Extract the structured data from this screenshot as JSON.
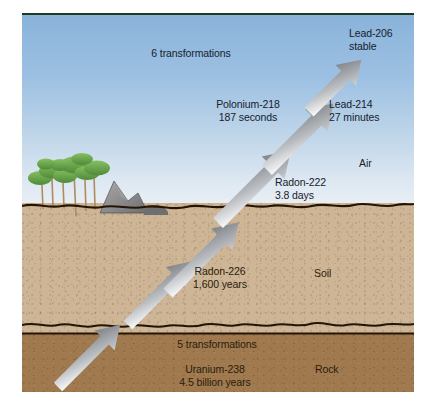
{
  "figure": {
    "layers": [
      {
        "key": "air",
        "label": "Air",
        "color": "#9cc0e2"
      },
      {
        "key": "soil",
        "label": "Soil",
        "color": "#cdb596"
      },
      {
        "key": "rock",
        "label": "Rock",
        "color": "#a07a4e"
      }
    ]
  },
  "labels": {
    "transformations_6": "6 transformations",
    "transformations_5": "5 transformations",
    "layer_air": "Air",
    "layer_soil": "Soil",
    "layer_rock": "Rock"
  },
  "nuclides": [
    {
      "id": "uranium-238",
      "name": "Uranium-238",
      "half_life": "4.5 billion years",
      "layer": "rock"
    },
    {
      "id": "radon-226",
      "name": "Radon-226",
      "half_life": "1,600 years",
      "layer": "soil"
    },
    {
      "id": "radon-222",
      "name": "Radon-222",
      "half_life": "3.8 days",
      "layer": "air"
    },
    {
      "id": "polonium-218",
      "name": "Polonium-218",
      "half_life": "187 seconds",
      "layer": "air"
    },
    {
      "id": "lead-214",
      "name": "Lead-214",
      "half_life": "27 minutes",
      "layer": "air"
    },
    {
      "id": "lead-206",
      "name": "Lead-206",
      "half_life": "stable",
      "layer": "air"
    }
  ],
  "colors": {
    "sky_top": "#8ab3da",
    "sky_bottom": "#e9eff4",
    "soil": "#cdb596",
    "rock": "#a07a4e",
    "boundary_line": "#241404",
    "arrow_head": "#7c7f84",
    "arrow_tail": "#ffffff",
    "tree_foliage": "#6aa84f",
    "tree_trunk": "#b08a60",
    "boulder": "#8d8d8d",
    "top_border": "#1d3a22"
  },
  "scenery": {
    "trees_label": "trees",
    "boulder_label": "boulder",
    "ground_label": "ground surface"
  }
}
